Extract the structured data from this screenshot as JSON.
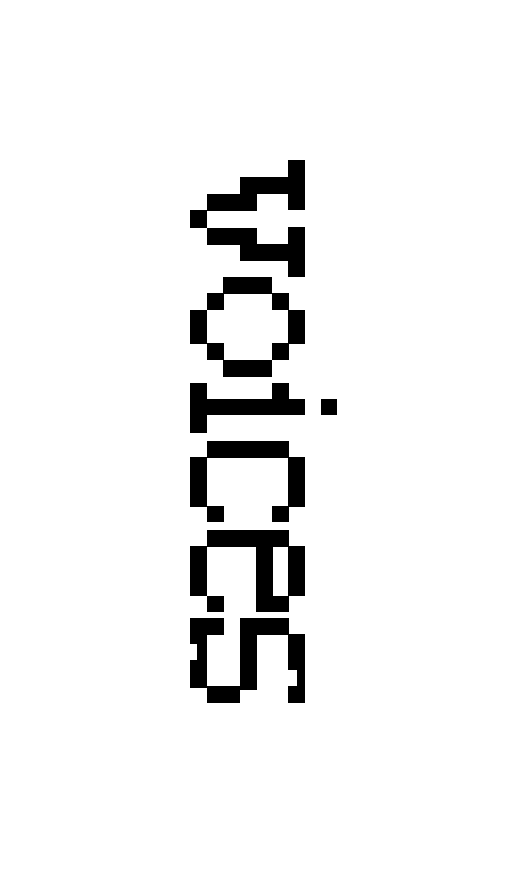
{
  "word": {
    "text": "voices",
    "orientation": "rotated-90-clockwise",
    "letters": [
      "v",
      "o",
      "i",
      "c",
      "e",
      "s"
    ],
    "ink_color": "#000000",
    "background_color": "#ffffff"
  }
}
